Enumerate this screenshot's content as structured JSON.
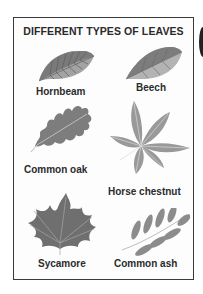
{
  "chart": {
    "title": "DIFFERENT TYPES OF LEAVES",
    "leaves": [
      {
        "name": "Hornbeam",
        "position": "top-left"
      },
      {
        "name": "Beech",
        "position": "top-right"
      },
      {
        "name": "Common oak",
        "position": "middle-left"
      },
      {
        "name": "Horse chestnut",
        "position": "middle-right"
      },
      {
        "name": "Sycamore",
        "position": "bottom-left"
      },
      {
        "name": "Common ash",
        "position": "bottom-right"
      }
    ]
  },
  "colors": {
    "leaf_dark": "#6f6f6f",
    "leaf_mid": "#8e8e8e",
    "leaf_light": "#b4b4b4",
    "text": "#2a2a2a",
    "border": "#3a3a3a"
  }
}
